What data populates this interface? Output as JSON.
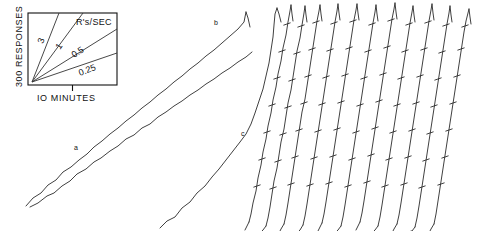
{
  "figure": {
    "kind": "cumulative-response-record",
    "background": "#ffffff",
    "ink_color": "#2a2a2a",
    "width": 482,
    "height": 231
  },
  "legend": {
    "name": "rate-calibration-key",
    "y_axis_label": "300 RESPONSES",
    "x_axis_label": "IO MINUTES",
    "heading": "R's/SEC",
    "box": {
      "x": 28,
      "y": 13,
      "width": 89,
      "height": 72
    },
    "x_tick_fraction": 0.5,
    "slope_labels": [
      "3",
      "1",
      "0.5",
      "0.25"
    ],
    "slopes": [
      {
        "label": "3",
        "rate": 3,
        "end_x": 0.3,
        "end_y": 0.0,
        "text_x": 41,
        "text_y": 40,
        "rotate": -72
      },
      {
        "label": "1",
        "rate": 1,
        "end_x": 0.62,
        "end_y": 0.0,
        "text_x": 57,
        "text_y": 45,
        "rotate": -57
      },
      {
        "label": "0.5",
        "rate": 0.5,
        "end_x": 1.0,
        "end_y": 0.22,
        "text_x": 77,
        "text_y": 55,
        "rotate": -31
      },
      {
        "label": "0.25",
        "rate": 0.25,
        "end_x": 1.0,
        "end_y": 0.56,
        "text_x": 84,
        "text_y": 73,
        "rotate": -20
      }
    ],
    "origin": {
      "x": 32,
      "y": 82
    }
  },
  "chart_data": {
    "type": "line",
    "title": "",
    "xlabel": "IO MINUTES",
    "ylabel": "300 RESPONSES",
    "grid": false,
    "legend_position": "top-left-inset",
    "axis_note": "Cumulative responses vs. time; slope = responses per second",
    "rate_key": [
      3,
      1,
      0.5,
      0.25
    ],
    "traces": [
      {
        "id": "a",
        "label": "a",
        "label_x": 74,
        "label_y": 150,
        "rate_rs_per_sec": 0.25,
        "event_marks": 0
      },
      {
        "id": "a2",
        "label": "",
        "rate_rs_per_sec": 0.25,
        "event_marks": 0
      },
      {
        "id": "b",
        "label": "b",
        "label_x": 214,
        "label_y": 25,
        "rate_rs_per_sec": 0.25,
        "event_marks": 0
      },
      {
        "id": "c",
        "label": "c",
        "label_x": 241,
        "label_y": 136,
        "rate_rs_per_sec": 0.5,
        "event_marks": 0
      },
      {
        "id": "d1",
        "label": "",
        "rate_rs_per_sec": 3,
        "event_marks": 5
      },
      {
        "id": "d2",
        "label": "",
        "rate_rs_per_sec": 3,
        "event_marks": 5
      },
      {
        "id": "d3",
        "label": "",
        "rate_rs_per_sec": 3,
        "event_marks": 5
      },
      {
        "id": "d4",
        "label": "",
        "rate_rs_per_sec": 3,
        "event_marks": 5
      },
      {
        "id": "d5",
        "label": "",
        "rate_rs_per_sec": 3,
        "event_marks": 5
      },
      {
        "id": "d6",
        "label": "",
        "rate_rs_per_sec": 3,
        "event_marks": 5
      },
      {
        "id": "d7",
        "label": "",
        "rate_rs_per_sec": 3,
        "event_marks": 5
      },
      {
        "id": "d8",
        "label": "",
        "rate_rs_per_sec": 3,
        "event_marks": 5
      },
      {
        "id": "d9",
        "label": "",
        "rate_rs_per_sec": 3,
        "event_marks": 5
      },
      {
        "id": "d10",
        "label": "",
        "rate_rs_per_sec": 3,
        "event_marks": 5
      },
      {
        "id": "d11",
        "label": "",
        "rate_rs_per_sec": 3,
        "event_marks": 5
      }
    ],
    "trace_labels": [
      "a",
      "b",
      "c"
    ]
  },
  "paths": {
    "a_lower": "M 30,207 L 38,203 L 47,196 L 54,193 L 62,186 L 70,181 L 77,174 L 86,169 L 94,162 L 101,158 L 110,151 L 118,146 L 126,139 L 134,135 L 142,128 L 150,124 L 158,117 L 166,112 L 174,106 L 182,101 L 190,95 L 198,90 L 206,84 L 214,79 L 222,73 L 230,68 L 238,62 L 246,57 L 252,52",
    "a_upper": "M 26,206 L 33,198 L 41,193 L 48,185 L 56,180 L 63,172 L 71,167 L 79,160 L 87,154 L 94,147 L 102,141 L 110,134 L 118,128 L 126,121 L 134,115 L 142,108 L 150,102 L 158,95 L 166,89 L 174,82 L 182,76 L 190,69 L 198,63 L 206,56 L 214,50 L 222,43 L 230,36 L 238,29 L 244,22 L 246,12",
    "b_tail": "M 246,12 L 248,18 L 250,27",
    "c": "M 160,228 L 167,221 L 175,217 L 182,208 L 190,202 L 197,193 L 205,186 L 212,177 L 219,169 L 226,160 L 233,151 L 240,142 L 246,134 L 251,124 L 255,113 L 259,101 L 263,89 L 266,76 L 269,63 L 271,50 L 273,37 L 274,25 L 275,14 L 277,8",
    "c_tail": "M 277,8 L 279,14 L 281,22",
    "steep": [
      "M 249,222 L 251,214 L 253,203 L 256,191 L 258,178 L 261,165 L 263,152 L 266,139 L 268,126 L 271,113 L 273,100 L 276,87 L 278,74 L 281,61 L 283,48 L 286,35 L 288,22 L 290,11 L 291,5",
      "M 266,226 L 268,218 L 270,207 L 272,194 L 274,181 L 277,168 L 279,155 L 281,142 L 284,129 L 286,116 L 288,103 L 291,90 L 293,77 L 295,64 L 297,51 L 300,38 L 302,25 L 304,13 L 305,6",
      "M 284,224 L 286,215 L 288,203 L 290,190 L 292,177 L 294,164 L 296,151 L 298,138 L 300,125 L 302,112 L 305,99 L 307,86 L 309,73 L 311,60 L 313,47 L 315,34 L 317,21 L 319,11 L 320,5",
      "M 303,225 L 305,216 L 307,204 L 309,191 L 311,178 L 313,165 L 315,152 L 317,139 L 319,126 L 321,113 L 323,100 L 325,87 L 327,74 L 329,61 L 331,48 L 333,35 L 335,22 L 337,11 L 338,4",
      "M 322,223 L 324,214 L 326,202 L 328,189 L 330,176 L 332,163 L 334,150 L 336,137 L 338,124 L 340,111 L 342,98 L 344,85 L 346,72 L 348,59 L 350,46 L 352,33 L 354,20 L 356,10 L 357,4",
      "M 341,226 L 343,217 L 345,205 L 347,192 L 349,179 L 351,166 L 353,153 L 355,140 L 357,127 L 359,114 L 361,101 L 363,88 L 365,75 L 367,62 L 369,49 L 371,36 L 373,23 L 375,12 L 376,5",
      "M 360,222 L 362,213 L 364,201 L 366,188 L 368,175 L 370,162 L 372,149 L 374,136 L 376,123 L 378,110 L 380,97 L 382,84 L 384,71 L 386,58 L 388,45 L 390,32 L 392,19 L 394,9 L 395,3",
      "M 378,226 L 380,217 L 382,205 L 384,192 L 386,179 L 388,166 L 390,153 L 392,140 L 394,127 L 396,114 L 398,101 L 400,88 L 402,75 L 404,62 L 406,49 L 408,36 L 410,23 L 412,12 L 413,6",
      "M 397,224 L 399,215 L 401,203 L 403,190 L 405,177 L 407,164 L 409,151 L 411,138 L 413,125 L 415,112 L 417,99 L 419,86 L 421,73 L 423,60 L 425,47 L 427,34 L 429,21 L 431,10 L 432,4",
      "M 415,227 L 417,218 L 419,206 L 421,193 L 423,180 L 425,167 L 427,154 L 429,141 L 431,128 L 433,115 L 435,102 L 437,89 L 439,76 L 441,63 L 443,50 L 445,37 L 447,24 L 449,13 L 450,6",
      "M 434,224 L 436,214 L 438,201 L 440,188 L 442,175 L 444,162 L 446,149 L 448,136 L 450,123 L 452,110 L 454,97 L 456,84 L 458,71 L 460,58 L 462,45 L 464,32 L 466,21 L 468,13 L 469,9"
    ],
    "resets": [
      "M 291,5 L 292,14 L 293,21",
      "M 305,6 L 306,15 L 307,22",
      "M 320,5 L 321,14 L 322,21",
      "M 338,4 L 339,13 L 340,20",
      "M 357,4 L 358,13 L 359,20",
      "M 376,5 L 377,14 L 378,21",
      "M 395,3 L 396,12 L 397,19",
      "M 413,6 L 414,15 L 415,22",
      "M 432,4 L 433,13 L 434,20",
      "M 450,6 L 451,15 L 452,22",
      "M 469,9 L 470,17 L 471,24"
    ],
    "bottom_hooks": [
      "M 249,222 L 246,228 L 245,230",
      "M 266,226 L 263,230 L 262,231",
      "M 284,224 L 281,229 L 280,231",
      "M 303,225 L 300,230 L 299,231",
      "M 322,223 L 319,229 L 318,231",
      "M 341,226 L 338,230 L 337,231",
      "M 360,222 L 357,228 L 356,230",
      "M 378,226 L 375,230 L 374,231",
      "M 397,224 L 394,229 L 393,231",
      "M 415,227 L 412,231 L 411,231",
      "M 434,224 L 431,229 L 430,231"
    ]
  },
  "event_marks": [
    [
      257,
      186
    ],
    [
      262,
      159
    ],
    [
      267,
      132
    ],
    [
      272,
      105
    ],
    [
      277,
      78
    ],
    [
      282,
      51
    ],
    [
      287,
      24
    ],
    [
      273,
      188
    ],
    [
      278,
      161
    ],
    [
      283,
      134
    ],
    [
      288,
      107
    ],
    [
      292,
      80
    ],
    [
      297,
      53
    ],
    [
      301,
      26
    ],
    [
      291,
      184
    ],
    [
      295,
      157
    ],
    [
      299,
      130
    ],
    [
      304,
      103
    ],
    [
      308,
      76
    ],
    [
      312,
      49
    ],
    [
      316,
      22
    ],
    [
      310,
      185
    ],
    [
      314,
      158
    ],
    [
      318,
      131
    ],
    [
      322,
      104
    ],
    [
      326,
      77
    ],
    [
      330,
      50
    ],
    [
      334,
      23
    ],
    [
      329,
      183
    ],
    [
      333,
      156
    ],
    [
      337,
      129
    ],
    [
      341,
      102
    ],
    [
      345,
      75
    ],
    [
      349,
      48
    ],
    [
      353,
      21
    ],
    [
      348,
      186
    ],
    [
      352,
      159
    ],
    [
      356,
      132
    ],
    [
      360,
      105
    ],
    [
      364,
      78
    ],
    [
      368,
      51
    ],
    [
      372,
      24
    ],
    [
      367,
      182
    ],
    [
      371,
      155
    ],
    [
      375,
      128
    ],
    [
      379,
      101
    ],
    [
      383,
      74
    ],
    [
      387,
      47
    ],
    [
      391,
      20
    ],
    [
      385,
      186
    ],
    [
      389,
      159
    ],
    [
      393,
      132
    ],
    [
      397,
      105
    ],
    [
      401,
      78
    ],
    [
      405,
      51
    ],
    [
      409,
      24
    ],
    [
      404,
      184
    ],
    [
      408,
      157
    ],
    [
      412,
      130
    ],
    [
      416,
      103
    ],
    [
      420,
      76
    ],
    [
      424,
      49
    ],
    [
      428,
      22
    ],
    [
      422,
      187
    ],
    [
      426,
      160
    ],
    [
      430,
      133
    ],
    [
      434,
      106
    ],
    [
      438,
      79
    ],
    [
      442,
      52
    ],
    [
      446,
      25
    ],
    [
      441,
      184
    ],
    [
      445,
      157
    ],
    [
      449,
      130
    ],
    [
      453,
      103
    ],
    [
      457,
      76
    ],
    [
      461,
      49
    ],
    [
      465,
      26
    ]
  ]
}
